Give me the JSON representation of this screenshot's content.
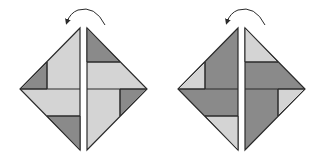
{
  "figure": {
    "colors": {
      "light": "#d4d4d4",
      "dark": "#8a8a8a",
      "stroke": "#2a2a2a",
      "background": "#ffffff"
    },
    "panels": [
      {
        "label": "left-diagram",
        "arrow": "counterclockwise rotation"
      },
      {
        "label": "right-diagram",
        "arrow": "counterclockwise rotation"
      }
    ]
  }
}
